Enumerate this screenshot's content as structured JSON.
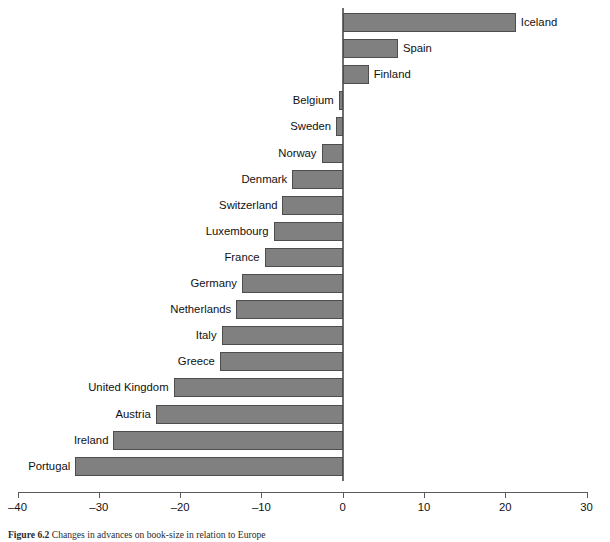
{
  "chart_data": {
    "type": "bar",
    "orientation": "horizontal",
    "title": "",
    "xlabel": "",
    "ylabel": "",
    "xlim": [
      -40,
      30
    ],
    "xticks": [
      -40,
      -30,
      -20,
      -10,
      0,
      10,
      20,
      30
    ],
    "xticklabels": [
      "–40",
      "–30",
      "–20",
      "–10",
      "0",
      "10",
      "20",
      "30"
    ],
    "grid": false,
    "legend": null,
    "zero_reference_line": 0,
    "bar_color": "#808080",
    "bar_edge_color": "#4d4d4d",
    "categories": [
      "Iceland",
      "Spain",
      "Finland",
      "Belgium",
      "Sweden",
      "Norway",
      "Denmark",
      "Switzerland",
      "Luxembourg",
      "France",
      "Germany",
      "Netherlands",
      "Italy",
      "Greece",
      "United Kingdom",
      "Austria",
      "Ireland",
      "Portugal"
    ],
    "values": [
      21.3,
      6.8,
      3.2,
      -0.5,
      -0.8,
      -2.6,
      -6.2,
      -7.4,
      -8.5,
      -9.6,
      -12.4,
      -13.1,
      -14.9,
      -15.1,
      -20.8,
      -23.0,
      -28.2,
      -32.9
    ]
  },
  "caption": {
    "number": "Figure 6.2",
    "text": "Changes in advances on book-size in relation to Europe"
  }
}
